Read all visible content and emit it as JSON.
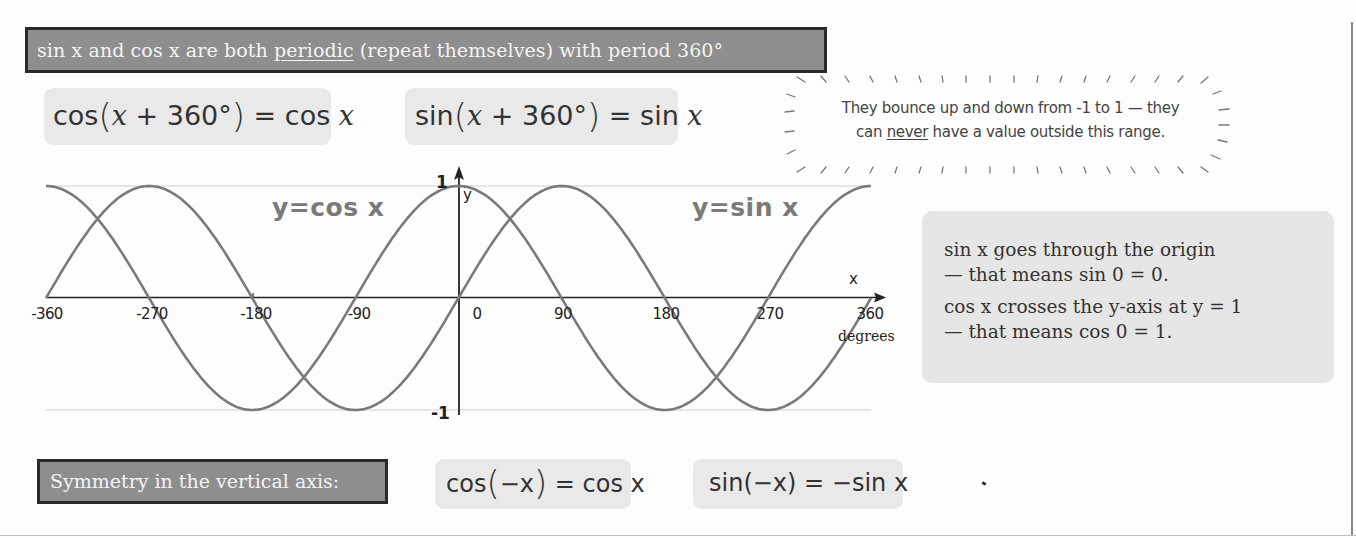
{
  "header": {
    "banner_before": "sin x and cos x are both ",
    "banner_underlined": "periodic",
    "banner_after": " (repeat themselves) with period 360°"
  },
  "formulas": {
    "cos_period": {
      "fn": "cos",
      "open": "(",
      "var": "x",
      "plus": " + 360°",
      "close": ")",
      "equals": " = cos ",
      "rhs_var": "x"
    },
    "sin_period": {
      "fn": "sin",
      "open": "(",
      "var": "x",
      "plus": " + 360°",
      "close": ")",
      "equals": " = sin ",
      "rhs_var": "x"
    },
    "cos_even": {
      "fn": "cos",
      "open": "(",
      "arg": "−x",
      "close": ")",
      "rhs": " = cos x"
    },
    "sin_odd": {
      "text": "sin(−x) = −sin x"
    }
  },
  "callout": {
    "line1": "They bounce up and down from -1 to 1 — they",
    "line2_before": "can ",
    "line2_underlined": "never",
    "line2_after": " have a value outside this range."
  },
  "info_box": {
    "lines": [
      "sin x goes through the origin",
      "— that means sin 0 = 0.",
      "cos x crosses the y-axis at y = 1",
      "— that means cos 0 = 1."
    ]
  },
  "symmetry": {
    "label": "Symmetry in the vertical axis:"
  },
  "chart_data": {
    "type": "line",
    "title": "",
    "xlabel": "x (degrees)",
    "ylabel": "y",
    "x_axis_end_label": "degrees",
    "x_axis_letter": "x",
    "y_axis_letter": "y",
    "xlim": [
      -360,
      360
    ],
    "ylim": [
      -1,
      1
    ],
    "x_ticks": [
      "-360",
      "-270",
      "-180",
      "-90",
      "0",
      "90",
      "180",
      "270",
      "360"
    ],
    "y_ticks": [
      "1",
      "-1"
    ],
    "grid": false,
    "reference_lines_at_y": [
      1,
      -1
    ],
    "x": [
      -360,
      -315,
      -270,
      -225,
      -180,
      -135,
      -90,
      -45,
      0,
      45,
      90,
      135,
      180,
      225,
      270,
      315,
      360
    ],
    "series": [
      {
        "name": "y=cos x",
        "values": [
          1,
          0.71,
          0,
          -0.71,
          -1,
          -0.71,
          0,
          0.71,
          1,
          0.71,
          0,
          -0.71,
          -1,
          -0.71,
          0,
          0.71,
          1
        ]
      },
      {
        "name": "y=sin x",
        "values": [
          0,
          0.71,
          1,
          0.71,
          0,
          -0.71,
          -1,
          -0.71,
          0,
          0.71,
          1,
          0.71,
          0,
          -0.71,
          -1,
          -0.71,
          0
        ]
      }
    ],
    "curve_labels": [
      "y=cos x",
      "y=sin x"
    ],
    "curve_color": "#7a7a7a"
  },
  "colors": {
    "banner_fill": "#8e8e8e",
    "banner_border": "#2a2a2a",
    "formula_fill": "#e9e9e9",
    "info_fill": "#e6e6e6",
    "curve": "#7a7a7a",
    "axis": "#222222"
  }
}
